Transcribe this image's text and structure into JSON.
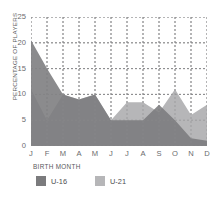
{
  "chart_data": {
    "type": "area",
    "title": "",
    "xlabel": "BIRTH MONTH",
    "ylabel": "PERCENTAGE OF PLAYERS",
    "categories": [
      "J",
      "F",
      "M",
      "A",
      "M",
      "J",
      "J",
      "A",
      "S",
      "O",
      "N",
      "D"
    ],
    "ytick_labels": [
      "25",
      "20",
      "15",
      "10",
      "5",
      "0"
    ],
    "ylim": [
      0,
      25
    ],
    "grid": true,
    "legend_position": "bottom",
    "series": [
      {
        "name": "U-16",
        "color": "#7b7b7d",
        "values": [
          20.5,
          15,
          10,
          9,
          10,
          5,
          5,
          5,
          8,
          5,
          1.5,
          1
        ]
      },
      {
        "name": "U-21",
        "color": "#b6b6b8",
        "values": [
          11,
          5,
          10,
          9,
          10,
          5,
          8.5,
          8.5,
          6.5,
          11,
          6,
          8
        ]
      }
    ]
  },
  "colors": {
    "u16": "#7b7b7d",
    "u21": "#b6b6b8",
    "axis_text": "#6b6b6d",
    "label_text": "#58585a",
    "grid": "#8a8a8c"
  }
}
